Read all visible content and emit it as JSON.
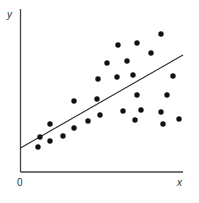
{
  "chart_data": {
    "type": "scatter",
    "title": "",
    "xlabel": "x",
    "ylabel": "y",
    "origin_label": "0",
    "grid": false,
    "legend": null,
    "axis_ticks": "none",
    "note": "Values are in pixel-derived units: x from y-axis (0) to right edge (~163), y from x-axis (0) upward (~163).",
    "xlim": [
      0,
      163
    ],
    "ylim": [
      0,
      163
    ],
    "points": [
      {
        "x": 17.5,
        "y": 25
      },
      {
        "x": 19.5,
        "y": 35
      },
      {
        "x": 29.5,
        "y": 31
      },
      {
        "x": 29.5,
        "y": 48
      },
      {
        "x": 42.5,
        "y": 36
      },
      {
        "x": 53.5,
        "y": 71
      },
      {
        "x": 53.5,
        "y": 44
      },
      {
        "x": 67.5,
        "y": 51
      },
      {
        "x": 76.5,
        "y": 73
      },
      {
        "x": 77.5,
        "y": 93
      },
      {
        "x": 79.5,
        "y": 57
      },
      {
        "x": 86.5,
        "y": 109
      },
      {
        "x": 96.5,
        "y": 95
      },
      {
        "x": 97.5,
        "y": 127
      },
      {
        "x": 106.5,
        "y": 111
      },
      {
        "x": 102.5,
        "y": 61
      },
      {
        "x": 112.5,
        "y": 97
      },
      {
        "x": 114.5,
        "y": 52
      },
      {
        "x": 116.5,
        "y": 77
      },
      {
        "x": 116.5,
        "y": 129
      },
      {
        "x": 120.5,
        "y": 62
      },
      {
        "x": 130.5,
        "y": 119
      },
      {
        "x": 140.5,
        "y": 60
      },
      {
        "x": 140.5,
        "y": 138
      },
      {
        "x": 142.5,
        "y": 48
      },
      {
        "x": 146.5,
        "y": 77
      },
      {
        "x": 152.5,
        "y": 96
      },
      {
        "x": 158.5,
        "y": 53
      }
    ],
    "trend_line": {
      "x0": 0,
      "y0": 24,
      "x1": 162.5,
      "y1": 117
    }
  },
  "layout": {
    "origin_px": [
      20.5,
      172
    ],
    "y_top_px": 9,
    "x_right_px": 183
  },
  "colors": {
    "axis": "#444444",
    "dot": "#111111",
    "line": "#333333",
    "label": "#333333"
  }
}
